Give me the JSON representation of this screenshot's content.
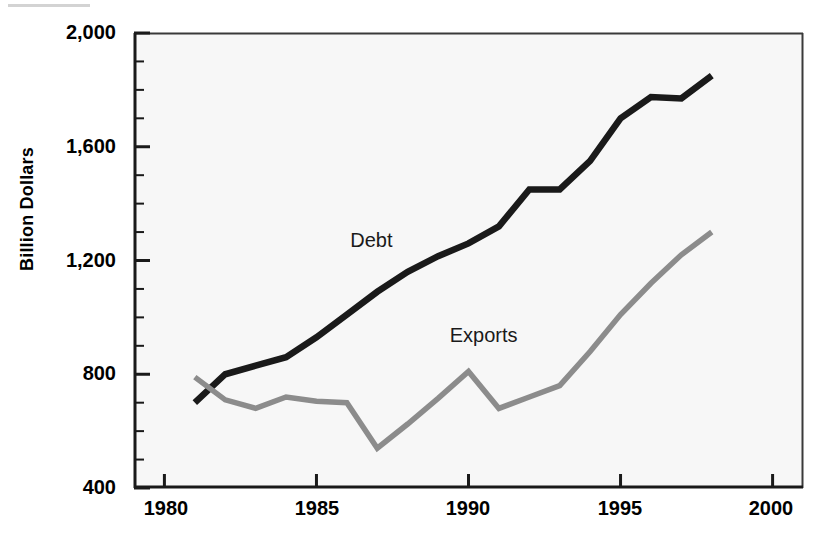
{
  "chart_data": {
    "type": "line",
    "title": "",
    "subtitle": "",
    "xlabel": "",
    "ylabel": "Billion Dollars",
    "xlim": [
      1979.0,
      2001.0
    ],
    "ylim": [
      400,
      2000
    ],
    "grid": false,
    "legend_position": "inline-annotation",
    "x_ticks": [
      "1980",
      "1985",
      "1990",
      "1995",
      "2000"
    ],
    "x_tick_values": [
      1980,
      1985,
      1990,
      1995,
      2000
    ],
    "y_ticks": [
      "400",
      "800",
      "1,200",
      "1,600",
      "2,000"
    ],
    "y_tick_values": [
      400,
      800,
      1200,
      1600,
      2000
    ],
    "y_minor_interval": 100,
    "x": [
      1981,
      1982,
      1983,
      1984,
      1985,
      1986,
      1987,
      1988,
      1989,
      1990,
      1991,
      1992,
      1993,
      1994,
      1995,
      1996,
      1997,
      1998
    ],
    "series": [
      {
        "name": "Debt",
        "color": "#1a1a1a",
        "values": [
          700,
          800,
          830,
          860,
          930,
          1010,
          1090,
          1160,
          1215,
          1260,
          1320,
          1450,
          1450,
          1550,
          1700,
          1775,
          1770,
          1850
        ]
      },
      {
        "name": "Exports",
        "color": "#8c8c8c",
        "values": [
          790,
          710,
          680,
          720,
          705,
          700,
          540,
          625,
          715,
          810,
          680,
          720,
          760,
          880,
          1010,
          1120,
          1220,
          1300
        ]
      }
    ],
    "annotations": [
      {
        "text": "Debt",
        "x": 1986.8,
        "y": 1270
      },
      {
        "text": "Exports",
        "x": 1990.5,
        "y": 935
      }
    ]
  },
  "axes": {
    "y_axis_label": "Billion Dollars"
  }
}
